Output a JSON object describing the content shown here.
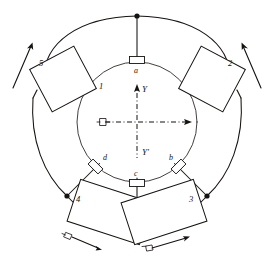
{
  "figure": {
    "name": "ring-machine-schematic",
    "background_color": "#ffffff",
    "ink_color": "#15120f"
  },
  "inner_circle": {
    "label": "1",
    "terminals": [
      {
        "id": "a",
        "label": "a",
        "position": "top"
      },
      {
        "id": "b",
        "label": "b",
        "position": "bottom-right"
      },
      {
        "id": "c",
        "label": "c",
        "position": "bottom"
      },
      {
        "id": "d",
        "label": "d",
        "position": "bottom-left"
      }
    ]
  },
  "axes": {
    "vertical_up_label": "Y",
    "vertical_down_label": "Y'",
    "horizontal_style": "dash-dot double arrow",
    "vertical_style": "dash-dot arrow up"
  },
  "blocks": [
    {
      "id": "b5",
      "label": "5",
      "position": "upper-left",
      "arrow": "up-right"
    },
    {
      "id": "b2",
      "label": "2",
      "position": "upper-right",
      "arrow": "up-left"
    },
    {
      "id": "b3",
      "label": "3",
      "position": "lower-right",
      "arrow": "right-up"
    },
    {
      "id": "b4",
      "label": "4",
      "position": "lower-left",
      "arrow": "right-down"
    }
  ],
  "motion_arrows": [
    {
      "id": "arrow-5",
      "near_block": "5",
      "direction": "up-right"
    },
    {
      "id": "arrow-2",
      "near_block": "2",
      "direction": "up-left"
    },
    {
      "id": "arrow-4",
      "near_block": "4",
      "direction": "right-down"
    },
    {
      "id": "arrow-3",
      "near_block": "3",
      "direction": "right-up"
    }
  ],
  "nodes": [
    {
      "id": "node-top",
      "location": "outer ring top"
    },
    {
      "id": "node-bottom",
      "location": "outer ring bottom"
    },
    {
      "id": "node-lower-left",
      "location": "outer ring lower left"
    },
    {
      "id": "node-lower-right",
      "location": "outer ring lower right"
    }
  ]
}
